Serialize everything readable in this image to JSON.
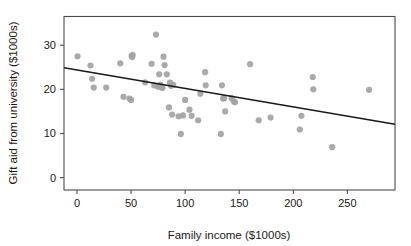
{
  "chart_data": {
    "type": "scatter",
    "title": "",
    "xlabel": "Family income ($1000s)",
    "ylabel": "Gift aid from university ($1000s)",
    "xlim": [
      -12,
      294
    ],
    "ylim": [
      -2.8,
      36.5
    ],
    "xticks": [
      0,
      50,
      100,
      150,
      200,
      250
    ],
    "xtick_labels": [
      "0",
      "50",
      "100",
      "150",
      "200",
      "250"
    ],
    "yticks": [
      0,
      10,
      20,
      30
    ],
    "ytick_labels": [
      "0",
      "10",
      "20",
      "30"
    ],
    "grid": false,
    "legend": null,
    "point_color": "#a3a3a3",
    "point_radius": 3.1,
    "line_color": "#1a1a1a",
    "axis_color": "#4d4d4d",
    "background": "#ffffff",
    "series": [
      {
        "name": "students",
        "x": [
          0.5,
          12.5,
          14.0,
          15.5,
          27.0,
          40.0,
          43.0,
          48.5,
          50.0,
          50.5,
          51.0,
          51.5,
          63.0,
          69.0,
          71.5,
          73.0,
          75.0,
          76.0,
          77.0,
          78.0,
          79.0,
          80.0,
          81.0,
          83.0,
          85.0,
          86.0,
          87.0,
          88.0,
          89.0,
          94.0,
          96.0,
          98.0,
          100.0,
          104.0,
          106.0,
          112.0,
          114.0,
          118.5,
          119.0,
          133.0,
          134.0,
          135.0,
          136.0,
          137.0,
          143.0,
          145.0,
          146.0,
          160.0,
          168.0,
          179.0,
          206.0,
          207.5,
          218.0,
          218.5,
          236.0,
          270.0
        ],
        "y": [
          27.5,
          25.4,
          22.4,
          20.4,
          20.4,
          25.9,
          18.3,
          17.9,
          17.6,
          27.6,
          27.3,
          27.8,
          21.6,
          25.8,
          20.9,
          32.4,
          20.6,
          23.4,
          21.0,
          20.5,
          20.3,
          27.4,
          25.5,
          23.4,
          15.9,
          21.5,
          20.8,
          14.3,
          21.0,
          13.9,
          9.9,
          14.1,
          17.6,
          15.4,
          14.0,
          13.0,
          19.0,
          23.9,
          20.9,
          9.9,
          20.9,
          17.9,
          18.0,
          15.0,
          18.0,
          17.3,
          17.1,
          25.7,
          13.0,
          13.6,
          10.9,
          14.0,
          22.8,
          20.0,
          6.9,
          19.9
        ]
      }
    ],
    "fit_line": {
      "name": "least-squares regression line",
      "x0": -12,
      "y0": 24.9,
      "x1": 294,
      "y1": 12.1
    }
  }
}
